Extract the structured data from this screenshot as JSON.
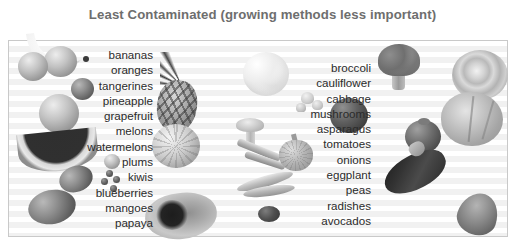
{
  "title": "Least Contaminated (growing methods less important)",
  "colors": {
    "title_text": "#6e6e6e",
    "list_text": "#2b2b2b",
    "panel_background": "#ffffff",
    "stripe": "#f1f1f1",
    "border": "#c9c9c9"
  },
  "columns": {
    "left": {
      "align": "right",
      "items": [
        "bananas",
        "oranges",
        "tangerines",
        "pineapple",
        "grapefruit",
        "melons",
        "watermelons",
        "plums",
        "kiwis",
        "blueberries",
        "mangoes",
        "papaya"
      ]
    },
    "right": {
      "align": "right",
      "items": [
        "broccoli",
        "cauliflower",
        "cabbage",
        "mushrooms",
        "asparagus",
        "tomatoes",
        "onions",
        "eggplant",
        "peas",
        "radishes",
        "avocados"
      ]
    }
  },
  "artwork": [
    "banana-image",
    "oranges-image",
    "tangerine-image",
    "grapefruit-image",
    "watermelon-slice-image",
    "plum-image",
    "kiwi-image",
    "blueberries-image",
    "mango-image",
    "papaya-image",
    "pineapple-image",
    "melon-image",
    "cauliflower-image",
    "broccoli-image",
    "cabbage-image",
    "mushrooms-image",
    "asparagus-image",
    "tomato-image",
    "onion-image",
    "eggplant-image",
    "pea-pods-image",
    "radish-image",
    "avocado-image"
  ]
}
